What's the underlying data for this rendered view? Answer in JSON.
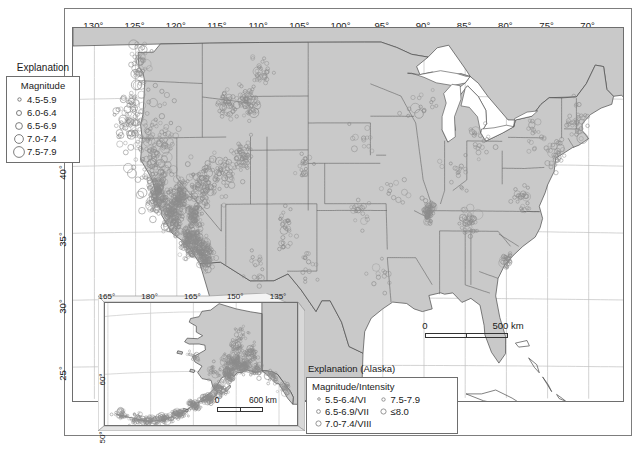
{
  "figure": {
    "type": "map",
    "background_color": "#ffffff",
    "land_fill": "#c9c9c9",
    "water_fill": "#ffffff",
    "symbol_color": "#8c8c8c",
    "border_color": "#4a4a4a",
    "graticule_color": "#c0c0c0"
  },
  "main_map": {
    "lon_labels": [
      "130°",
      "125°",
      "120°",
      "115°",
      "110°",
      "105°",
      "100°",
      "95°",
      "90°",
      "85°",
      "80°",
      "75°",
      "70°"
    ],
    "lon_values": [
      130,
      125,
      120,
      115,
      110,
      105,
      100,
      95,
      90,
      85,
      80,
      75,
      70
    ],
    "lat_labels": [
      "45°",
      "40°",
      "35°",
      "30°",
      "25°"
    ],
    "lat_values": [
      45,
      40,
      35,
      30,
      25
    ],
    "scalebar": {
      "zero": "0",
      "length_label": "500 km"
    }
  },
  "explanation_main": {
    "title": "Explanation",
    "subtitle": "Magnitude",
    "items": [
      {
        "label": "4.5-5.9",
        "radius": 1.7
      },
      {
        "label": "6.0-6.4",
        "radius": 2.5
      },
      {
        "label": "6.5-6.9",
        "radius": 3.4
      },
      {
        "label": "7.0-7.4",
        "radius": 4.4
      },
      {
        "label": "7.5-7.9",
        "radius": 5.4
      }
    ]
  },
  "alaska_inset": {
    "lon_labels": [
      "165°",
      "180°",
      "165°",
      "150°",
      "135°"
    ],
    "lat_labels": [
      "60°",
      "50°"
    ],
    "scalebar": {
      "zero": "0",
      "length_label": "600 km"
    }
  },
  "explanation_alaska": {
    "title": "Explanation (Alaska)",
    "subtitle": "Magnitude/Intensity",
    "column_left": [
      {
        "label": "5.5-6.4/VI",
        "radius": 1.3
      },
      {
        "label": "6.5-6.9/VII",
        "radius": 1.9
      },
      {
        "label": "7.0-7.4/VIII",
        "radius": 2.6
      }
    ],
    "column_right": [
      {
        "label": "7.5-7.9",
        "radius": 1.7
      },
      {
        "label": "≤8.0",
        "radius": 2.6
      }
    ]
  },
  "chart_data": {
    "type": "scatter",
    "xlabel": "Longitude",
    "ylabel": "Latitude",
    "xlim": [
      -132,
      -66
    ],
    "ylim": [
      23,
      50
    ],
    "legend_position": "left",
    "grid": true
  }
}
